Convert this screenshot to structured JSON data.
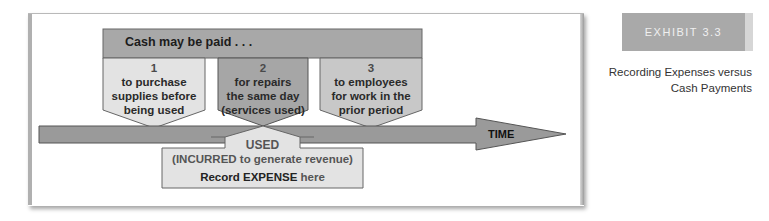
{
  "header": {
    "label": "Cash may be paid . . ."
  },
  "boxes": [
    {
      "number": "1",
      "lines": [
        "to purchase",
        "supplies before",
        "being used"
      ],
      "color": "#e3e3e3"
    },
    {
      "number": "2",
      "lines": [
        "for repairs",
        "the same day",
        "(services used)"
      ],
      "color": "#a6a6a6"
    },
    {
      "number": "3",
      "lines": [
        "to employees",
        "for work in the",
        "prior period"
      ],
      "color": "#c8c8c8"
    }
  ],
  "timeline": {
    "label": "TIME",
    "color": "#9a9a9a"
  },
  "used_box": {
    "title": "USED",
    "subtitle": "(INCURRED to generate revenue)",
    "record_prefix": "Record",
    "record_emphasis": "EXPENSE",
    "record_suffix": "here",
    "color": "#e3e3e3"
  },
  "exhibit": {
    "tag": "EXHIBIT 3.3",
    "caption_line1": "Recording Expenses versus",
    "caption_line2": "Cash Payments"
  },
  "colors": {
    "header_bar": "#a8a8a8",
    "exhibit_tag": "#a9a9a9",
    "outline": "#555555"
  }
}
